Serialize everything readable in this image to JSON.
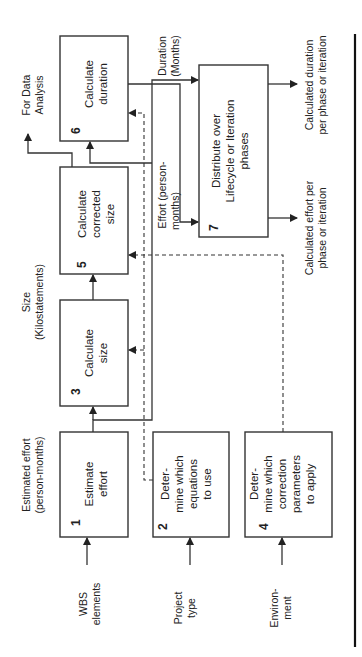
{
  "diagram": {
    "orientation": "rotated-90-ccw",
    "boxes": [
      {
        "id": 1,
        "number": "1",
        "lines": [
          "Estimate",
          "effort"
        ]
      },
      {
        "id": 2,
        "number": "2",
        "lines": [
          "Deter-",
          "mine which",
          "equations",
          "to use"
        ]
      },
      {
        "id": 3,
        "number": "3",
        "lines": [
          "Calculate",
          "size"
        ]
      },
      {
        "id": 4,
        "number": "4",
        "lines": [
          "Deter-",
          "mine which",
          "correction",
          "parameters",
          "to apply"
        ]
      },
      {
        "id": 5,
        "number": "5",
        "lines": [
          "Calculate",
          "corrected",
          "size"
        ]
      },
      {
        "id": 6,
        "number": "6",
        "lines": [
          "Calculate",
          "duration"
        ]
      },
      {
        "id": 7,
        "number": "7",
        "lines": [
          "Distribute over",
          "Lifecycle or Iteration",
          "phases"
        ]
      }
    ],
    "inputs": {
      "wbs": [
        "WBS",
        "elements"
      ],
      "project_type": [
        "Project",
        "type"
      ],
      "environment": [
        "Environ-",
        "ment"
      ]
    },
    "flow_labels": {
      "estimated_effort": [
        "Estimated effort",
        "(person-months)"
      ],
      "size": [
        "Size",
        "(Kilostatements)"
      ],
      "effort": [
        "Effort (person-",
        "months)"
      ],
      "duration": [
        "Duration",
        "(Months)"
      ],
      "data_analysis": [
        "For Data",
        "Analysis"
      ]
    },
    "outputs": {
      "effort_per_phase": [
        "Calculated effort per",
        "phase or iteration"
      ],
      "duration_per_phase": [
        "Calculated duration",
        "per phase or iteration"
      ]
    }
  }
}
